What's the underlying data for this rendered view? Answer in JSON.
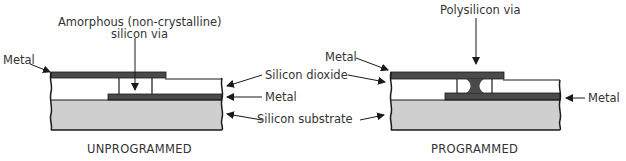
{
  "diagram": {
    "colors": {
      "metal": "#4a4a4a",
      "substrate": "#cfcfcf",
      "dioxide": "#ffffff",
      "outline": "#1a1a1a"
    },
    "unprogrammed": {
      "caption": "UNPROGRAMMED",
      "via_label_line1": "Amorphous (non-crystalline)",
      "via_label_line2": "silicon via",
      "metal_label": "Metal"
    },
    "programmed": {
      "caption": "PROGRAMMED",
      "via_label": "Polysilicon via",
      "metal_top_label": "Metal",
      "metal_bottom_label": "Metal"
    },
    "shared_labels": {
      "silicon_dioxide": "Silicon dioxide",
      "metal": "Metal",
      "silicon_substrate": "Silicon substrate"
    }
  }
}
